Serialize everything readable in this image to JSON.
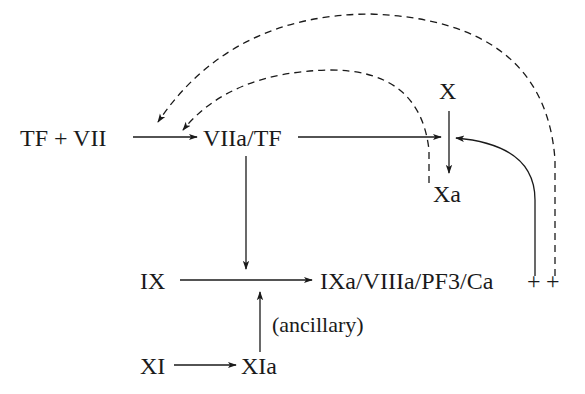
{
  "diagram": {
    "nodes": {
      "tf_vii": "TF + VII",
      "viia_tf": "VIIa/TF",
      "x": "X",
      "xa": "Xa",
      "ix": "IX",
      "ixa_complex": "IXa/VIIIa/PF3/Ca",
      "plus1": "+",
      "plus2": "+",
      "xi": "XI",
      "xia": "XIa"
    },
    "edge_labels": {
      "ancillary": "(ancillary)"
    },
    "edges": [
      {
        "from": "TF + VII",
        "to": "VIIa/TF",
        "style": "solid"
      },
      {
        "from": "VIIa/TF",
        "to": "X→Xa",
        "style": "solid"
      },
      {
        "from": "VIIa/TF",
        "to": "IX→IXa/VIIIa/PF3/Ca",
        "style": "solid"
      },
      {
        "from": "X",
        "to": "Xa",
        "style": "solid"
      },
      {
        "from": "IX",
        "to": "IXa/VIIIa/PF3/Ca",
        "style": "solid"
      },
      {
        "from": "XI",
        "to": "XIa",
        "style": "solid"
      },
      {
        "from": "XIa",
        "to": "IX→IXa/VIIIa/PF3/Ca",
        "style": "solid",
        "label": "(ancillary)"
      },
      {
        "from": "IXa/VIIIa/PF3/Ca",
        "to": "X→Xa",
        "style": "solid"
      },
      {
        "from": "Xa",
        "to": "TF + VII→VIIa/TF",
        "style": "dashed"
      },
      {
        "from": "IXa/VIIIa/PF3/Ca",
        "to": "TF + VII→VIIa/TF",
        "style": "dashed"
      }
    ],
    "colors": {
      "ink": "#1a1a1a",
      "background": "#ffffff"
    }
  }
}
